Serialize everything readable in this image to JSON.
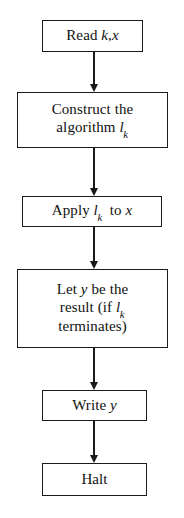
{
  "diagram": {
    "type": "flowchart",
    "orientation": "top-to-bottom",
    "stroke_color": "#1a1a1a",
    "background_color": "#ffffff",
    "nodes": [
      {
        "id": "read",
        "shape": "rectangle",
        "lines": [
          {
            "parts": [
              {
                "text": "Read ",
                "style": "roman"
              },
              {
                "text": "k",
                "style": "italic"
              },
              {
                "text": ",",
                "style": "roman"
              },
              {
                "text": "x",
                "style": "italic"
              }
            ]
          }
        ],
        "plain_text": "Read k,x"
      },
      {
        "id": "construct",
        "shape": "rectangle",
        "lines": [
          {
            "parts": [
              {
                "text": "Construct the",
                "style": "roman"
              }
            ]
          },
          {
            "parts": [
              {
                "text": "algorithm ",
                "style": "roman"
              },
              {
                "text": "l",
                "style": "italic"
              },
              {
                "text": "k",
                "style": "subscript"
              }
            ]
          }
        ],
        "plain_text": "Construct the algorithm l_k"
      },
      {
        "id": "apply",
        "shape": "rectangle",
        "lines": [
          {
            "parts": [
              {
                "text": "Apply ",
                "style": "roman"
              },
              {
                "text": "l",
                "style": "italic"
              },
              {
                "text": "k",
                "style": "subscript"
              },
              {
                "text": "  to ",
                "style": "roman"
              },
              {
                "text": "x",
                "style": "italic"
              }
            ]
          }
        ],
        "plain_text": "Apply l_k to x"
      },
      {
        "id": "let",
        "shape": "rectangle",
        "lines": [
          {
            "parts": [
              {
                "text": "Let ",
                "style": "roman"
              },
              {
                "text": "y",
                "style": "italic"
              },
              {
                "text": " be the",
                "style": "roman"
              }
            ]
          },
          {
            "parts": [
              {
                "text": "result (if ",
                "style": "roman"
              },
              {
                "text": "l",
                "style": "italic"
              },
              {
                "text": "k",
                "style": "subscript"
              }
            ]
          },
          {
            "parts": [
              {
                "text": "terminates)",
                "style": "roman"
              }
            ]
          }
        ],
        "plain_text": "Let y be the result (if l_k terminates)"
      },
      {
        "id": "write",
        "shape": "rectangle",
        "lines": [
          {
            "parts": [
              {
                "text": "Write ",
                "style": "roman"
              },
              {
                "text": "y",
                "style": "italic"
              }
            ]
          }
        ],
        "plain_text": "Write y"
      },
      {
        "id": "halt",
        "shape": "rectangle",
        "lines": [
          {
            "parts": [
              {
                "text": "Halt",
                "style": "roman"
              }
            ]
          }
        ],
        "plain_text": "Halt"
      }
    ],
    "edges": [
      {
        "id": "edge-1",
        "from": "read",
        "to": "construct",
        "style": "arrow-down"
      },
      {
        "id": "edge-2",
        "from": "construct",
        "to": "apply",
        "style": "arrow-down"
      },
      {
        "id": "edge-3",
        "from": "apply",
        "to": "let",
        "style": "arrow-down"
      },
      {
        "id": "edge-4",
        "from": "let",
        "to": "write",
        "style": "arrow-down"
      },
      {
        "id": "edge-5",
        "from": "write",
        "to": "halt",
        "style": "arrow-down"
      }
    ]
  }
}
